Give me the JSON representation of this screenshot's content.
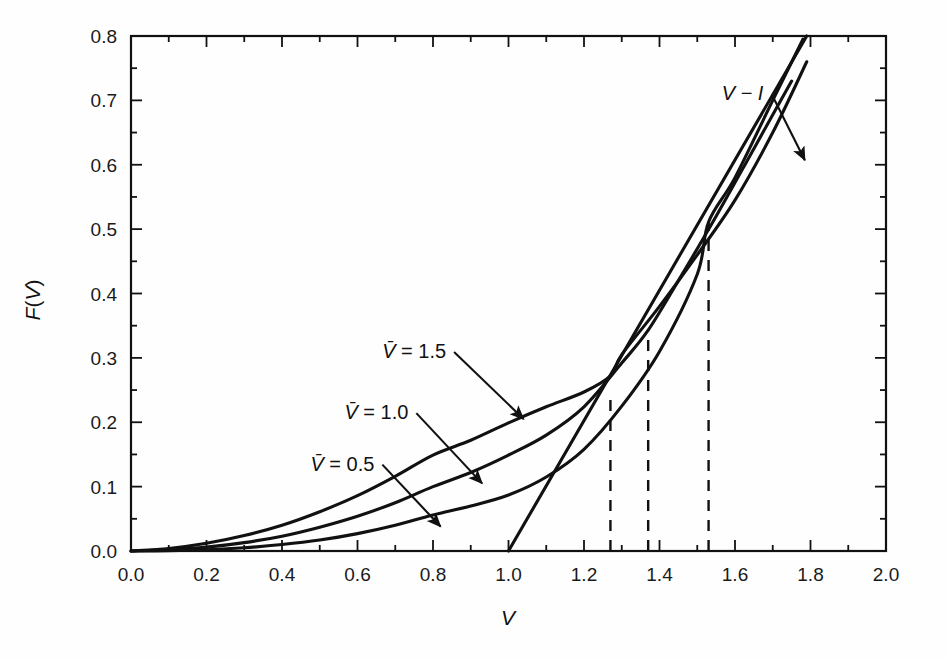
{
  "figure": {
    "background_color": "#fefefe",
    "line_color": "#111111",
    "axis_color": "#111111"
  },
  "chart_data": {
    "type": "line",
    "title": "",
    "xlabel": "V",
    "ylabel": "F(V)",
    "xlim": [
      0.0,
      2.0
    ],
    "ylim": [
      0.0,
      0.8
    ],
    "grid": false,
    "legend": "none (inline annotated labels with arrows)",
    "x_ticks_major": [
      "0.0",
      "0.2",
      "0.4",
      "0.6",
      "0.8",
      "1.0",
      "1.2",
      "1.4",
      "1.6",
      "1.8",
      "2.0"
    ],
    "x_tick_values": [
      0.0,
      0.2,
      0.4,
      0.6,
      0.8,
      1.0,
      1.2,
      1.4,
      1.6,
      1.8,
      2.0
    ],
    "x_minor_step": 0.1,
    "y_ticks_major": [
      "0.0",
      "0.1",
      "0.2",
      "0.3",
      "0.4",
      "0.5",
      "0.6",
      "0.7",
      "0.8"
    ],
    "y_tick_values": [
      0.0,
      0.1,
      0.2,
      0.3,
      0.4,
      0.5,
      0.6,
      0.7,
      0.8
    ],
    "y_minor_step": 0.05,
    "series": [
      {
        "name": "V-bar = 1.5",
        "label": "V̄ = 1.5",
        "style": "solid",
        "x": [
          0.0,
          0.1,
          0.2,
          0.3,
          0.4,
          0.5,
          0.6,
          0.7,
          0.8,
          0.9,
          1.0,
          1.1,
          1.2,
          1.27,
          1.3,
          1.4,
          1.5,
          1.6,
          1.7,
          1.79
        ],
        "y": [
          0.0,
          0.004,
          0.012,
          0.024,
          0.04,
          0.061,
          0.086,
          0.116,
          0.149,
          0.172,
          0.199,
          0.224,
          0.247,
          0.272,
          0.305,
          0.38,
          0.46,
          0.545,
          0.65,
          0.76
        ]
      },
      {
        "name": "V-bar = 1.0",
        "label": "V̄ = 1.0",
        "style": "solid",
        "x": [
          0.0,
          0.1,
          0.2,
          0.3,
          0.4,
          0.5,
          0.6,
          0.7,
          0.8,
          0.9,
          1.0,
          1.1,
          1.2,
          1.3,
          1.37,
          1.45,
          1.55,
          1.65,
          1.75
        ],
        "y": [
          0.0,
          0.002,
          0.006,
          0.013,
          0.023,
          0.037,
          0.054,
          0.075,
          0.1,
          0.122,
          0.149,
          0.18,
          0.224,
          0.292,
          0.343,
          0.42,
          0.52,
          0.625,
          0.73
        ]
      },
      {
        "name": "V-bar = 0.5",
        "label": "V̄ = 0.5",
        "style": "solid",
        "x": [
          0.0,
          0.1,
          0.2,
          0.3,
          0.4,
          0.5,
          0.6,
          0.7,
          0.8,
          0.9,
          1.0,
          1.1,
          1.2,
          1.3,
          1.4,
          1.5,
          1.53,
          1.6,
          1.7,
          1.78
        ],
        "y": [
          0.0,
          0.0005,
          0.002,
          0.005,
          0.01,
          0.017,
          0.027,
          0.04,
          0.056,
          0.07,
          0.087,
          0.115,
          0.158,
          0.225,
          0.31,
          0.43,
          0.511,
          0.58,
          0.7,
          0.795
        ]
      },
      {
        "name": "V minus I line",
        "label": "V − I",
        "style": "solid-straight",
        "x": [
          1.0,
          1.79
        ],
        "y": [
          0.0,
          0.8
        ]
      }
    ],
    "dashed_verticals": [
      {
        "x": 1.27,
        "y_top": 0.247,
        "label": ""
      },
      {
        "x": 1.37,
        "y_top": 0.343,
        "label": ""
      },
      {
        "x": 1.53,
        "y_top": 0.511,
        "label": ""
      }
    ],
    "annotations": [
      {
        "id": "vi-label",
        "text": "V − I",
        "x": 1.62,
        "y": 0.7,
        "arrow_to_x": 1.785,
        "arrow_to_y": 0.607
      },
      {
        "id": "vbar-15-label",
        "text": "V̄ = 1.5",
        "x": 0.75,
        "y": 0.3,
        "arrow_to_x": 1.04,
        "arrow_to_y": 0.205
      },
      {
        "id": "vbar-10-label",
        "text": "V̄ = 1.0",
        "x": 0.65,
        "y": 0.205,
        "arrow_to_x": 0.93,
        "arrow_to_y": 0.105
      },
      {
        "id": "vbar-05-label",
        "text": "V̄ = 0.5",
        "x": 0.56,
        "y": 0.125,
        "arrow_to_x": 0.82,
        "arrow_to_y": 0.038
      }
    ]
  },
  "labels": {
    "x_axis_title": "V",
    "y_axis_title_f": "F",
    "y_axis_title_paren_open": "(",
    "y_axis_title_v": "V",
    "y_axis_title_paren_close": ")",
    "vi_annotation": "V − I",
    "vbar_15": "V̄ = 1.5",
    "vbar_10": "V̄ = 1.0",
    "vbar_05": "V̄ = 0.5"
  }
}
